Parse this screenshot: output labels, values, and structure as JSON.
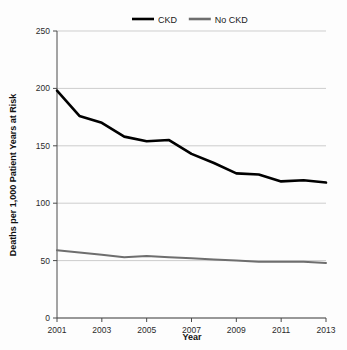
{
  "chart_data": {
    "type": "line",
    "title": "",
    "xlabel": "Year",
    "ylabel": "Deaths per 1,000 Patient Years at Risk",
    "xlim": [
      2001,
      2013
    ],
    "ylim": [
      0,
      250
    ],
    "yticks": [
      0,
      50,
      100,
      150,
      200,
      250
    ],
    "xticks": [
      2001,
      2003,
      2005,
      2007,
      2009,
      2011,
      2013
    ],
    "xticks_all": [
      2001,
      2002,
      2003,
      2004,
      2005,
      2006,
      2007,
      2008,
      2009,
      2010,
      2011,
      2012,
      2013
    ],
    "grid": "horizontal",
    "legend_position": "top-center",
    "x": [
      2001,
      2002,
      2003,
      2004,
      2005,
      2006,
      2007,
      2008,
      2009,
      2010,
      2011,
      2012,
      2013
    ],
    "series": [
      {
        "name": "CKD",
        "color": "#000000",
        "values": [
          198,
          176,
          170,
          158,
          154,
          155,
          143,
          135,
          126,
          125,
          119,
          120,
          118
        ]
      },
      {
        "name": "No CKD",
        "color": "#6e6e6e",
        "values": [
          59,
          57,
          55,
          53,
          54,
          53,
          52,
          51,
          50,
          49,
          49,
          49,
          48
        ]
      }
    ]
  },
  "legend": {
    "items": [
      {
        "label": "CKD",
        "color": "#000000"
      },
      {
        "label": "No CKD",
        "color": "#6e6e6e"
      }
    ]
  },
  "axes": {
    "y_title": "Deaths per 1,000 Patient Years at Risk",
    "x_title": "Year",
    "y_tick_labels": [
      "0",
      "50",
      "100",
      "150",
      "200",
      "250"
    ],
    "x_tick_labels": [
      "2001",
      "2003",
      "2005",
      "2007",
      "2009",
      "2011",
      "2013"
    ]
  },
  "style": {
    "background": "#fdfdfd",
    "grid_color": "#b9b9b9",
    "axis_color": "#4a4a4a"
  }
}
